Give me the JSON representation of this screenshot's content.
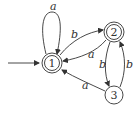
{
  "diagram": {
    "type": "finite-automaton",
    "start_state": "1",
    "colors": {
      "stroke": "#333333",
      "background": "#ffffff"
    },
    "states": [
      {
        "id": "1",
        "label": "1",
        "accepting": true,
        "start": true
      },
      {
        "id": "2",
        "label": "2",
        "accepting": true,
        "start": false
      },
      {
        "id": "3",
        "label": "3",
        "accepting": false,
        "start": false
      }
    ],
    "transitions": [
      {
        "from": "1",
        "to": "1",
        "label": "a"
      },
      {
        "from": "1",
        "to": "2",
        "label": "b"
      },
      {
        "from": "2",
        "to": "1",
        "label": "a"
      },
      {
        "from": "2",
        "to": "3",
        "label": "b"
      },
      {
        "from": "3",
        "to": "2",
        "label": "b"
      },
      {
        "from": "3",
        "to": "1",
        "label": "a"
      }
    ]
  }
}
